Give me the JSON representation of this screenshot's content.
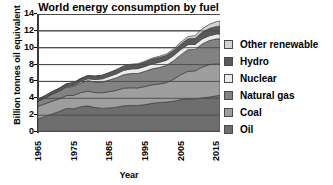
{
  "chart_data": {
    "type": "area",
    "title": "World energy consumption by fuel",
    "xlabel": "Year",
    "ylabel": "Billion tonnes oil equivalent",
    "xlim": [
      1965,
      2016
    ],
    "ylim": [
      0,
      14
    ],
    "ytick_labels": [
      "0",
      "2",
      "4",
      "6",
      "8",
      "10",
      "12",
      "14"
    ],
    "ytick_values": [
      0,
      2,
      4,
      6,
      8,
      10,
      12,
      14
    ],
    "xtick_labels": [
      "1965",
      "1975",
      "1985",
      "1995",
      "2005",
      "2015"
    ],
    "xtick_values": [
      1965,
      1975,
      1985,
      1995,
      2005,
      2015
    ],
    "grid": "horizontal",
    "legend_position": "right",
    "stacked": true,
    "stack_order_bottom_to_top": [
      "Oil",
      "Coal",
      "Natural gas",
      "Nuclear",
      "Hydro",
      "Other renewable"
    ],
    "x": [
      1965,
      1967,
      1969,
      1971,
      1973,
      1975,
      1977,
      1979,
      1981,
      1983,
      1985,
      1987,
      1989,
      1991,
      1993,
      1995,
      1997,
      1999,
      2001,
      2003,
      2005,
      2007,
      2009,
      2011,
      2013,
      2015,
      2016
    ],
    "series": [
      {
        "name": "Oil",
        "color": "#6e6e6e",
        "values": [
          1.55,
          1.85,
          2.15,
          2.45,
          2.8,
          2.75,
          3.0,
          3.1,
          2.9,
          2.8,
          2.85,
          2.95,
          3.1,
          3.15,
          3.15,
          3.25,
          3.4,
          3.5,
          3.55,
          3.65,
          3.85,
          3.95,
          3.9,
          4.05,
          4.15,
          4.3,
          4.35
        ]
      },
      {
        "name": "Coal",
        "color": "#9e9e9e",
        "values": [
          1.5,
          1.5,
          1.52,
          1.5,
          1.52,
          1.6,
          1.68,
          1.75,
          1.78,
          1.85,
          1.95,
          2.0,
          2.1,
          2.1,
          2.08,
          2.15,
          2.2,
          2.2,
          2.3,
          2.6,
          2.95,
          3.25,
          3.35,
          3.65,
          3.85,
          3.8,
          3.7
        ]
      },
      {
        "name": "Natural gas",
        "color": "#828282",
        "values": [
          0.6,
          0.7,
          0.82,
          0.92,
          1.02,
          1.05,
          1.15,
          1.25,
          1.25,
          1.28,
          1.38,
          1.48,
          1.6,
          1.68,
          1.72,
          1.8,
          1.9,
          1.95,
          2.05,
          2.2,
          2.35,
          2.55,
          2.55,
          2.75,
          2.85,
          2.95,
          3.0
        ]
      },
      {
        "name": "Nuclear",
        "color": "#ececec",
        "values": [
          0.01,
          0.02,
          0.03,
          0.05,
          0.08,
          0.12,
          0.17,
          0.22,
          0.3,
          0.38,
          0.42,
          0.48,
          0.52,
          0.55,
          0.57,
          0.58,
          0.6,
          0.62,
          0.62,
          0.62,
          0.63,
          0.62,
          0.59,
          0.6,
          0.57,
          0.58,
          0.59
        ]
      },
      {
        "name": "Hydro",
        "color": "#5a5a5a",
        "values": [
          0.22,
          0.24,
          0.26,
          0.28,
          0.3,
          0.32,
          0.34,
          0.36,
          0.38,
          0.4,
          0.42,
          0.44,
          0.46,
          0.48,
          0.5,
          0.52,
          0.55,
          0.57,
          0.58,
          0.6,
          0.64,
          0.68,
          0.72,
          0.78,
          0.85,
          0.89,
          0.91
        ]
      },
      {
        "name": "Other renewable",
        "color": "#d2d2d2",
        "values": [
          0.01,
          0.01,
          0.01,
          0.01,
          0.02,
          0.02,
          0.02,
          0.03,
          0.03,
          0.04,
          0.05,
          0.06,
          0.07,
          0.08,
          0.09,
          0.1,
          0.12,
          0.14,
          0.16,
          0.19,
          0.23,
          0.28,
          0.33,
          0.42,
          0.5,
          0.58,
          0.62
        ]
      }
    ]
  },
  "legend": {
    "items": [
      {
        "label": "Other renewable",
        "color": "#d2d2d2"
      },
      {
        "label": "Hydro",
        "color": "#5a5a5a"
      },
      {
        "label": "Nuclear",
        "color": "#ececec"
      },
      {
        "label": "Natural gas",
        "color": "#828282"
      },
      {
        "label": "Coal",
        "color": "#9e9e9e"
      },
      {
        "label": "Oil",
        "color": "#6e6e6e"
      }
    ]
  },
  "colors": {
    "grid": "#4a4a4a",
    "axis": "#3a3a3a",
    "text": "#000000",
    "background": "#ffffff"
  }
}
